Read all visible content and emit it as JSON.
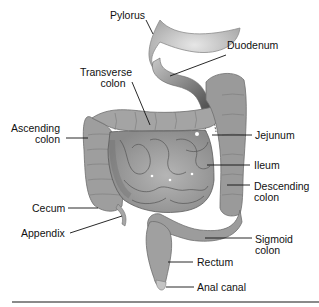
{
  "diagram": {
    "colors": {
      "organ_fill": "#9c9c9c",
      "organ_dark": "#7a7a7a",
      "organ_light": "#c4c4c4",
      "outline": "#555555",
      "leader": "#111111",
      "rule": "#8a8a8a"
    },
    "labels": {
      "pylorus": "Pylorus",
      "duodenum": "Duodenum",
      "transverse_colon_1": "Transverse",
      "transverse_colon_2": "colon",
      "ascending_colon_1": "Ascending",
      "ascending_colon_2": "colon",
      "jejunum": "Jejunum",
      "ileum": "Ileum",
      "descending_colon_1": "Descending",
      "descending_colon_2": "colon",
      "cecum": "Cecum",
      "appendix": "Appendix",
      "sigmoid_colon_1": "Sigmoid",
      "sigmoid_colon_2": "colon",
      "rectum": "Rectum",
      "anal_canal": "Anal canal"
    }
  }
}
